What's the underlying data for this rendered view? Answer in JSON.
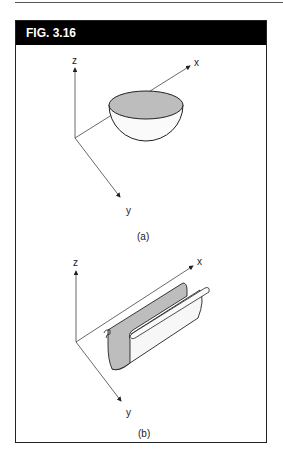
{
  "figure": {
    "title": "FIG. 3.16",
    "panels": [
      {
        "id": "a",
        "caption": "(a)",
        "axes": {
          "x": "x",
          "y": "y",
          "z": "z"
        },
        "shape": "hemispherical bowl"
      },
      {
        "id": "b",
        "caption": "(b)",
        "axes": {
          "x": "x",
          "y": "y",
          "z": "z"
        },
        "shape": "half-cylinder trough"
      }
    ]
  },
  "colors": {
    "header_bg": "#000000",
    "header_text": "#ffffff",
    "fill_gray": "#bdbdbd",
    "line": "#222222"
  }
}
